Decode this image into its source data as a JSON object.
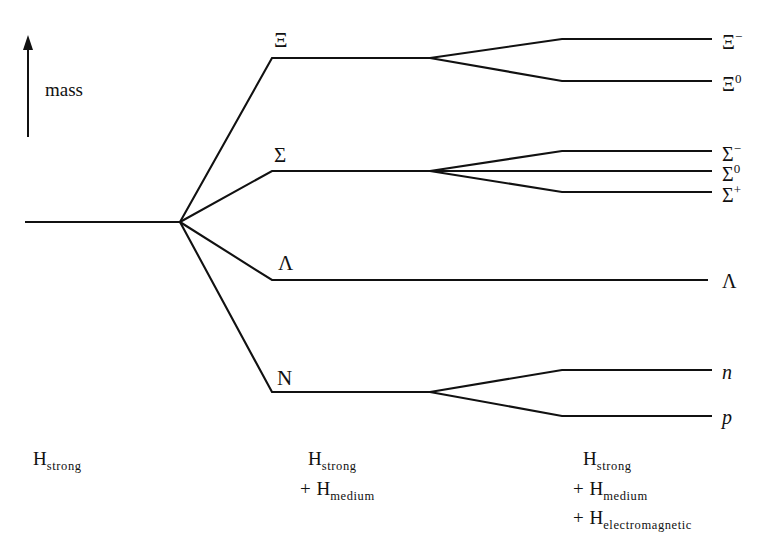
{
  "figure": {
    "kind": "baryon-octet-mass-splitting-level-diagram",
    "axis": {
      "label": "mass",
      "direction": "up"
    },
    "stroke_color": "#111111",
    "background_color": "#ffffff"
  },
  "multiplet_labels": [
    {
      "id": "xi",
      "text": "Ξ",
      "x": 274,
      "y": 30
    },
    {
      "id": "sigma",
      "text": "Σ",
      "x": 274,
      "y": 145
    },
    {
      "id": "lambda",
      "text": "Λ",
      "x": 278,
      "y": 253
    },
    {
      "id": "nucleon",
      "text": "N",
      "x": 277,
      "y": 368
    }
  ],
  "state_labels": [
    {
      "id": "xi-minus",
      "base": "Ξ",
      "sup": "−",
      "italic": false,
      "x": 722,
      "y": 30
    },
    {
      "id": "xi-zero",
      "base": "Ξ",
      "sup": "0",
      "italic": false,
      "x": 722,
      "y": 72
    },
    {
      "id": "sigma-minus",
      "base": "Σ",
      "sup": "−",
      "italic": false,
      "x": 722,
      "y": 142
    },
    {
      "id": "sigma-zero",
      "base": "Σ",
      "sup": "0",
      "italic": false,
      "x": 722,
      "y": 162
    },
    {
      "id": "sigma-plus",
      "base": "Σ",
      "sup": "+",
      "italic": false,
      "x": 722,
      "y": 183
    },
    {
      "id": "lambda-right",
      "base": "Λ",
      "sup": "",
      "italic": false,
      "x": 722,
      "y": 271
    },
    {
      "id": "neutron",
      "base": "n",
      "sup": "",
      "italic": true,
      "x": 722,
      "y": 362
    },
    {
      "id": "proton",
      "base": "p",
      "sup": "",
      "italic": true,
      "x": 722,
      "y": 407
    }
  ],
  "hamiltonian_columns": [
    {
      "id": "column-strong",
      "rows": [
        {
          "plus": "",
          "base": "H",
          "sub": "strong"
        }
      ]
    },
    {
      "id": "column-strong-medium",
      "rows": [
        {
          "plus": "",
          "base": "H",
          "sub": "strong"
        },
        {
          "plus": "+",
          "base": "H",
          "sub": "medium"
        }
      ]
    },
    {
      "id": "column-strong-medium-em",
      "rows": [
        {
          "plus": "",
          "base": "H",
          "sub": "strong"
        },
        {
          "plus": "+",
          "base": "H",
          "sub": "medium"
        },
        {
          "plus": "+",
          "base": "H",
          "sub": "electromagnetic"
        }
      ]
    }
  ],
  "geometry": {
    "axis_arrow": {
      "x": 28,
      "y_top": 48,
      "y_bottom": 137,
      "head_half_width": 5,
      "head_height": 13
    },
    "axis_label_pos": {
      "x": 45,
      "y": 80
    },
    "unsplit_baseline": {
      "x_start": 25,
      "x_end": 180,
      "y": 222
    },
    "fan_vertex": {
      "x": 180,
      "y": 222
    },
    "level_1_plateau_x_start": 272,
    "level_1_plateau_x_end": 430,
    "level_2_split_x": 430,
    "level_2_bend_x": 562,
    "level_2_plateau_x_end": 712,
    "lambda_plateau_x_end": 708,
    "branches": [
      {
        "id": "branch-xi",
        "plateau_y": 58,
        "children": [
          39,
          81
        ]
      },
      {
        "id": "branch-sigma",
        "plateau_y": 171,
        "children": [
          151,
          171,
          192
        ]
      },
      {
        "id": "branch-lambda",
        "plateau_y": 280,
        "children": []
      },
      {
        "id": "branch-nucleon",
        "plateau_y": 392,
        "children": [
          370,
          416
        ]
      }
    ]
  }
}
